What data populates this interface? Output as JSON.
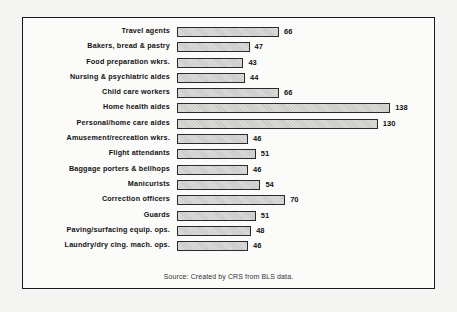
{
  "chart_data": {
    "type": "bar",
    "orientation": "horizontal",
    "title": "",
    "xlabel": "",
    "ylabel": "",
    "categories": [
      "Travel agents",
      "Bakers, bread & pastry",
      "Food preparation wkrs.",
      "Nursing & psychiatric aides",
      "Child care workers",
      "Home health aides",
      "Personal/home care aides",
      "Amusement/recreation wkrs.",
      "Flight attendants",
      "Baggage porters & bellhops",
      "Manicurists",
      "Correction officers",
      "Guards",
      "Paving/surfacing equip. ops.",
      "Laundry/dry clng. mach. ops."
    ],
    "values": [
      66,
      47,
      43,
      44,
      66,
      138,
      130,
      46,
      51,
      46,
      54,
      70,
      51,
      48,
      46
    ],
    "value_labels": [
      "66",
      "47",
      "43",
      "44",
      "66",
      "138",
      "130",
      "46",
      "51",
      "46",
      "54",
      "70",
      "51",
      "48",
      "46"
    ],
    "xlim": [
      0,
      140
    ],
    "grid": false,
    "legend": null,
    "data_labels": true,
    "bar_color": "#c9c9c7",
    "bar_border": "#2a2a2a",
    "source": "Source:  Created by CRS from BLS data."
  },
  "source_note": "Source:  Created by CRS from BLS data."
}
